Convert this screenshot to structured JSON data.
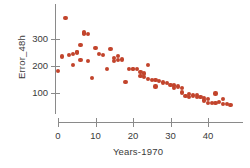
{
  "chart_data": {
    "type": "scatter",
    "title": "",
    "xlabel": "Years-1970",
    "ylabel": "Error_48h",
    "xlim": [
      -1,
      48
    ],
    "ylim": [
      30,
      395
    ],
    "xticks": [
      0,
      10,
      20,
      30,
      40
    ],
    "yticks": [
      100,
      200,
      300
    ],
    "grid": false,
    "legend": null,
    "marker_color": "#c2442c",
    "axis_color": "#8a8a8a",
    "text_color": "#3a3a3a",
    "series": [
      {
        "name": "Error_48h",
        "points": [
          [
            0,
            182
          ],
          [
            1,
            235
          ],
          [
            2,
            378
          ],
          [
            3,
            240
          ],
          [
            4,
            243
          ],
          [
            4,
            204
          ],
          [
            5,
            250
          ],
          [
            5,
            253
          ],
          [
            6,
            277
          ],
          [
            6,
            222
          ],
          [
            7,
            322
          ],
          [
            7,
            318
          ],
          [
            7,
            324
          ],
          [
            8,
            317
          ],
          [
            8,
            219
          ],
          [
            9,
            157
          ],
          [
            10,
            267
          ],
          [
            11,
            243
          ],
          [
            12,
            240
          ],
          [
            13,
            188
          ],
          [
            14,
            263
          ],
          [
            15,
            231
          ],
          [
            15,
            219
          ],
          [
            16,
            238
          ],
          [
            16,
            222
          ],
          [
            17,
            224
          ],
          [
            18,
            141
          ],
          [
            19,
            190
          ],
          [
            20,
            189
          ],
          [
            20,
            190
          ],
          [
            21,
            189
          ],
          [
            22,
            164
          ],
          [
            22,
            177
          ],
          [
            23,
            172
          ],
          [
            23,
            158
          ],
          [
            24,
            205
          ],
          [
            24,
            152
          ],
          [
            25,
            148
          ],
          [
            26,
            124
          ],
          [
            26,
            147
          ],
          [
            27,
            143
          ],
          [
            28,
            139
          ],
          [
            29,
            136
          ],
          [
            30,
            131
          ],
          [
            31,
            128
          ],
          [
            31,
            120
          ],
          [
            32,
            124
          ],
          [
            33,
            102
          ],
          [
            33,
            118
          ],
          [
            34,
            88
          ],
          [
            35,
            95
          ],
          [
            35,
            85
          ],
          [
            36,
            91
          ],
          [
            37,
            92
          ],
          [
            37,
            84
          ],
          [
            38,
            86
          ],
          [
            39,
            72
          ],
          [
            39,
            82
          ],
          [
            40,
            63
          ],
          [
            40,
            77
          ],
          [
            41,
            64
          ],
          [
            42,
            63
          ],
          [
            42,
            98
          ],
          [
            43,
            66
          ],
          [
            44,
            60
          ],
          [
            44,
            79
          ],
          [
            45,
            58
          ],
          [
            46,
            57
          ]
        ]
      }
    ]
  }
}
